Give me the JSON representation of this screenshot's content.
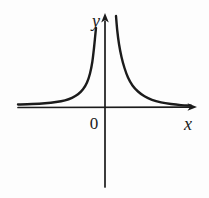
{
  "figure": {
    "background": "#fdfdfd",
    "ink_color": "#1b1b1b",
    "labels": {
      "y_axis": "y",
      "x_axis": "x",
      "origin": "0"
    }
  },
  "chart_data": {
    "type": "line",
    "title": "",
    "xlabel": "x",
    "ylabel": "y",
    "origin_label": "0",
    "grid": false,
    "legend": false,
    "axis_ticks": [],
    "function": "y = k/x^2 style reciprocal-squared curve; both branches lie above the x-axis",
    "asymptotes": {
      "vertical": "x = 0 (y-axis)",
      "horizontal": "y = 0 (x-axis)"
    },
    "series": [
      {
        "name": "left-branch",
        "x_range": [
          -2.2,
          -0.25
        ],
        "sample_points": [
          [
            -2.2,
            0.09
          ],
          [
            -1.5,
            0.19
          ],
          [
            -1.0,
            0.44
          ],
          [
            -0.7,
            0.9
          ],
          [
            -0.5,
            1.76
          ],
          [
            -0.35,
            3.6
          ],
          [
            -0.25,
            7.0
          ]
        ]
      },
      {
        "name": "right-branch",
        "x_range": [
          0.25,
          2.2
        ],
        "sample_points": [
          [
            0.25,
            7.9
          ],
          [
            0.35,
            3.6
          ],
          [
            0.5,
            1.76
          ],
          [
            0.7,
            0.9
          ],
          [
            1.0,
            0.44
          ],
          [
            1.5,
            0.19
          ],
          [
            2.2,
            0.09
          ]
        ]
      }
    ],
    "render_px": {
      "canvas": [
        209,
        198
      ],
      "origin": [
        105,
        107.5
      ],
      "x_axis": {
        "from": [
          18,
          107.5
        ],
        "to": [
          190.5,
          107.2
        ],
        "arrow_tip": [
          197,
          107
        ]
      },
      "y_axis": {
        "from": [
          105,
          187
        ],
        "to": [
          105,
          21
        ],
        "arrow_tip": [
          105,
          13
        ]
      },
      "x_arrowhead": [
        [
          197,
          107
        ],
        [
          187.5,
          103.2
        ],
        [
          190,
          107
        ],
        [
          187.5,
          110.8
        ]
      ],
      "y_arrowhead": [
        [
          105,
          13
        ],
        [
          101.2,
          22.5
        ],
        [
          105,
          20
        ],
        [
          108.8,
          22.5
        ]
      ],
      "left_branch": [
        [
          18,
          104.5
        ],
        [
          32,
          104
        ],
        [
          45,
          103.2
        ],
        [
          56,
          102
        ],
        [
          65,
          100.3
        ],
        [
          72,
          97.8
        ],
        [
          78,
          94.3
        ],
        [
          83,
          89.3
        ],
        [
          87,
          82.5
        ],
        [
          90,
          73.5
        ],
        [
          92.3,
          62
        ],
        [
          94,
          48
        ],
        [
          95.2,
          36
        ],
        [
          96,
          28
        ]
      ],
      "right_branch": [
        [
          116,
          16
        ],
        [
          117.2,
          30
        ],
        [
          119,
          44
        ],
        [
          121.5,
          57
        ],
        [
          124.5,
          68
        ],
        [
          128,
          77.5
        ],
        [
          132.5,
          85.5
        ],
        [
          138,
          91.5
        ],
        [
          144.5,
          96.3
        ],
        [
          152,
          99.8
        ],
        [
          161,
          102.3
        ],
        [
          171,
          104
        ],
        [
          181,
          105.1
        ],
        [
          191,
          105.6
        ]
      ]
    }
  }
}
